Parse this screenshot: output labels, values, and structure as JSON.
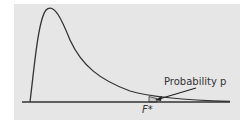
{
  "diagram": {
    "type": "F-distribution density curve with upper-tail area",
    "labels": {
      "probability": "Probability p",
      "critical_value": "F*"
    },
    "colors": {
      "background": "#e6e6e6",
      "curve": "#333333",
      "tail_fill": "#c8c8c8"
    }
  }
}
